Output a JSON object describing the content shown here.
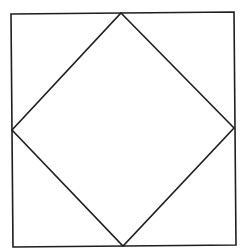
{
  "diagram": {
    "title": "",
    "background": "#ffffff",
    "stroke_color": "#1e1e1e",
    "stroke_width": 1.6,
    "outer_square": {
      "points": [
        [
          11,
          14
        ],
        [
          234,
          12
        ],
        [
          236,
          245
        ],
        [
          13,
          247
        ]
      ]
    },
    "inner_diamond": {
      "points": [
        [
          121,
          13
        ],
        [
          234,
          128
        ],
        [
          123,
          246
        ],
        [
          12,
          130
        ]
      ]
    }
  }
}
